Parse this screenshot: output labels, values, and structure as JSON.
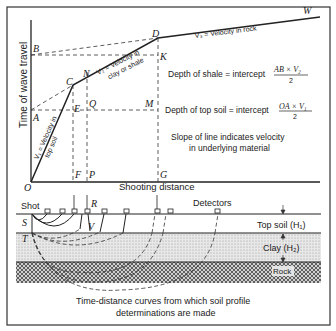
{
  "figure": {
    "caption_line1": "Time-distance curves from which soil profile",
    "caption_line2": "determinations are made",
    "colors": {
      "ink": "#222222",
      "clay_fill": "#e4e4e4",
      "rock_fill": "#9a9a9a",
      "background": "#ffffff"
    }
  },
  "graph": {
    "y_axis_label": "Time of wave travel",
    "x_axis_label": "Shooting distance",
    "points": {
      "O": "O",
      "A": "A",
      "B": "B",
      "C": "C",
      "N": "N",
      "D": "D",
      "W": "W",
      "E": "E",
      "Q": "Q",
      "M": "M",
      "K": "K",
      "F": "F",
      "P": "P",
      "G": "G"
    },
    "segment_labels": {
      "v1_line1": "V₁ = Velocity in",
      "v1_line2": "top soil",
      "v2_line1": "V₂ = Velocity in",
      "v2_line2": "clay or shale",
      "v3": "V₃ = Velocity in rock"
    },
    "annotations": {
      "depth_shale": "Depth of shale = intercept",
      "depth_shale_num": "AB × V₂",
      "depth_shale_den": "2",
      "depth_topsoil": "Depth of top soil = intercept",
      "depth_topsoil_num": "OA × V₁",
      "depth_topsoil_den": "2",
      "slope_line1": "Slope of line indicates velocity",
      "slope_line2": "in underlying material"
    }
  },
  "profile": {
    "shot_label": "Shot",
    "detectors_label": "Detectors",
    "points": {
      "S": "S",
      "T": "T",
      "R": "R",
      "V": "V"
    },
    "layers": {
      "top_soil": "Top soil (H₁)",
      "clay": "Clay (H₂)",
      "rock": "Rock"
    }
  }
}
